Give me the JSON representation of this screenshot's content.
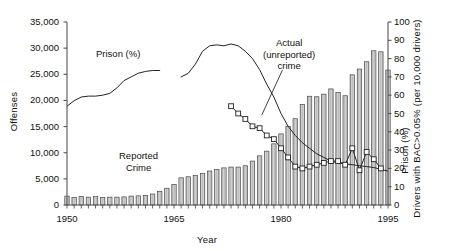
{
  "chart_data": {
    "type": "bar",
    "title": "",
    "xlabel": "Year",
    "ylabel": "Offenses",
    "ylabel_right_primary": "Prison (%)",
    "ylabel_right_secondary": "Drivers with BAC>0.05% (per 10,000 drivers)",
    "xlim": [
      1950,
      1995
    ],
    "ylim": [
      0,
      35000
    ],
    "ylim_right": [
      0,
      100
    ],
    "grid": false,
    "legend": "none",
    "x_ticks": [
      1950,
      1965,
      1980,
      1995
    ],
    "x_tick_labels": [
      "1950",
      "1965",
      "1980",
      "1995"
    ],
    "y_ticks_left": [
      0,
      5000,
      10000,
      15000,
      20000,
      25000,
      30000,
      35000
    ],
    "y_tick_labels_left": [
      "0",
      "5,000",
      "10,000",
      "15,000",
      "20,000",
      "25,000",
      "30,000",
      "35,000"
    ],
    "y_ticks_right": [
      0,
      10,
      20,
      30,
      40,
      50,
      60,
      70,
      80,
      90,
      100
    ],
    "y_tick_labels_right": [
      "0",
      "10",
      "20",
      "30",
      "40",
      "50",
      "60",
      "70",
      "80",
      "90",
      "100"
    ],
    "annotations": [
      {
        "text": "Prison (%)",
        "x": 1963,
        "y": 26800,
        "series": "prison"
      },
      {
        "text": "Actual\n(unreported)\ncrime",
        "x": 1981,
        "y": 31500,
        "series": "bac"
      },
      {
        "text": "Reported\nCrime",
        "x": 1964,
        "y": 12000,
        "series": "reported_crime"
      }
    ],
    "annotation_lines": [
      {
        "from_x": 1980.2,
        "from_y": 25800,
        "to_x": 1977.3,
        "to_y": 17200
      }
    ],
    "series": [
      {
        "name": "Reported Crime",
        "type": "bar",
        "axis": "left",
        "x": [
          1950,
          1951,
          1952,
          1953,
          1954,
          1955,
          1956,
          1957,
          1958,
          1959,
          1960,
          1961,
          1962,
          1963,
          1964,
          1965,
          1966,
          1967,
          1968,
          1969,
          1970,
          1971,
          1972,
          1973,
          1974,
          1975,
          1976,
          1977,
          1978,
          1979,
          1980,
          1981,
          1982,
          1983,
          1984,
          1985,
          1986,
          1987,
          1988,
          1989,
          1990,
          1991,
          1992,
          1993,
          1994,
          1995
        ],
        "values": [
          1700,
          1450,
          1650,
          1500,
          1600,
          1450,
          1500,
          1500,
          1550,
          1700,
          1750,
          1800,
          2100,
          2600,
          3200,
          3900,
          5200,
          5400,
          5650,
          6000,
          6500,
          6800,
          7100,
          7250,
          7250,
          7500,
          8400,
          9400,
          10300,
          11700,
          13600,
          15000,
          16500,
          19200,
          20800,
          20700,
          21200,
          22200,
          21500,
          20900,
          24900,
          26000,
          27400,
          29500,
          29300,
          25800
        ],
        "fill": "#c9c9c9",
        "edge": "#4a4a4a"
      },
      {
        "name": "Prison (%)",
        "type": "line",
        "axis": "right",
        "x": [
          1950,
          1951,
          1952,
          1953,
          1954,
          1955,
          1956,
          1957,
          1958,
          1959,
          1960,
          1961,
          1962,
          1963,
          1966,
          1967,
          1968,
          1969,
          1970,
          1971,
          1972,
          1973,
          1974,
          1975,
          1976,
          1977,
          1978,
          1979,
          1980,
          1981,
          1982,
          1983,
          1984,
          1985,
          1986,
          1987,
          1988,
          1989,
          1990,
          1991,
          1992,
          1993,
          1994,
          1995
        ],
        "values": [
          54,
          57,
          59,
          59.5,
          59.5,
          60,
          61,
          64,
          68,
          70,
          72,
          73,
          73.5,
          73.5,
          70,
          72,
          77,
          84,
          87,
          87.5,
          87,
          88,
          87,
          84,
          80,
          74,
          66,
          59,
          50,
          43,
          38,
          34,
          31,
          28,
          26,
          24,
          23,
          22.5,
          22,
          21.5,
          21,
          20.5,
          19.5,
          18.5
        ],
        "gap_between": [
          1963,
          1966
        ],
        "color": "#222222"
      },
      {
        "name": "Actual (unreported) crime",
        "type": "line-markers",
        "axis": "right",
        "x": [
          1973,
          1974,
          1975,
          1976,
          1977,
          1978,
          1979,
          1980,
          1981,
          1982,
          1983,
          1984,
          1985,
          1986,
          1987,
          1988,
          1989,
          1990,
          1991,
          1992,
          1993,
          1994
        ],
        "values": [
          54,
          50,
          47,
          43,
          42,
          38,
          36,
          31,
          26,
          21,
          20,
          21,
          22,
          23,
          24,
          24,
          22,
          31,
          19,
          29,
          25,
          20
        ],
        "marker": "square-open",
        "color": "#222222"
      }
    ]
  },
  "axis_labels": {
    "left_title": "Offenses",
    "right_title_prison": "Prison (%)",
    "right_title_bac": "Drivers with BAC>0.05% (per 10,000 drivers)",
    "x_title": "Year"
  },
  "annotation_text": {
    "prison": "Prison (%)",
    "actual_line1": "Actual",
    "actual_line2": "(unreported)",
    "actual_line3": "crime",
    "reported_line1": "Reported",
    "reported_line2": "Crime"
  },
  "colors": {
    "bar_fill": "#c9c9c9",
    "bar_edge": "#4a4a4a",
    "line": "#222222",
    "axis": "#555555",
    "text": "#111111",
    "background": "#ffffff"
  }
}
